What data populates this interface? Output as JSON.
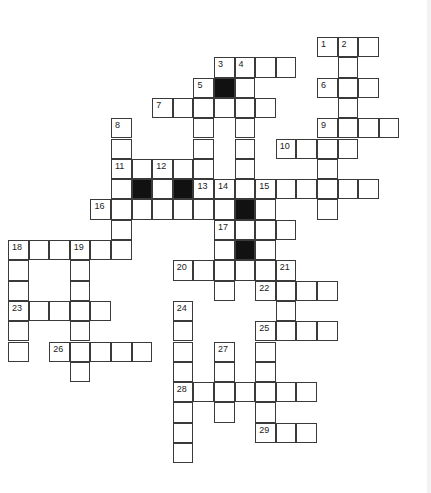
{
  "puzzle": {
    "type": "crossword",
    "colors": {
      "cell_fill": "#ffffff",
      "block_fill": "#111111",
      "border": "#3a3a3a"
    },
    "cells": [
      {
        "r": 0,
        "c": 15,
        "n": "1"
      },
      {
        "r": 0,
        "c": 16,
        "n": "2"
      },
      {
        "r": 0,
        "c": 17
      },
      {
        "r": 1,
        "c": 10,
        "n": "3"
      },
      {
        "r": 1,
        "c": 11,
        "n": "4"
      },
      {
        "r": 1,
        "c": 12
      },
      {
        "r": 1,
        "c": 13
      },
      {
        "r": 1,
        "c": 16
      },
      {
        "r": 2,
        "c": 9,
        "n": "5"
      },
      {
        "r": 2,
        "c": 10,
        "b": true
      },
      {
        "r": 2,
        "c": 11
      },
      {
        "r": 2,
        "c": 15,
        "n": "6"
      },
      {
        "r": 2,
        "c": 16
      },
      {
        "r": 2,
        "c": 17
      },
      {
        "r": 3,
        "c": 7,
        "n": "7"
      },
      {
        "r": 3,
        "c": 8
      },
      {
        "r": 3,
        "c": 9
      },
      {
        "r": 3,
        "c": 10
      },
      {
        "r": 3,
        "c": 11
      },
      {
        "r": 3,
        "c": 12
      },
      {
        "r": 3,
        "c": 16
      },
      {
        "r": 4,
        "c": 5,
        "n": "8"
      },
      {
        "r": 4,
        "c": 9
      },
      {
        "r": 4,
        "c": 11
      },
      {
        "r": 4,
        "c": 15,
        "n": "9"
      },
      {
        "r": 4,
        "c": 16
      },
      {
        "r": 4,
        "c": 17
      },
      {
        "r": 4,
        "c": 18
      },
      {
        "r": 5,
        "c": 5
      },
      {
        "r": 5,
        "c": 9
      },
      {
        "r": 5,
        "c": 11
      },
      {
        "r": 5,
        "c": 13,
        "n": "10"
      },
      {
        "r": 5,
        "c": 14
      },
      {
        "r": 5,
        "c": 15
      },
      {
        "r": 5,
        "c": 16
      },
      {
        "r": 6,
        "c": 5,
        "n": "11"
      },
      {
        "r": 6,
        "c": 6
      },
      {
        "r": 6,
        "c": 7,
        "n": "12"
      },
      {
        "r": 6,
        "c": 8
      },
      {
        "r": 6,
        "c": 9
      },
      {
        "r": 6,
        "c": 11
      },
      {
        "r": 6,
        "c": 15
      },
      {
        "r": 7,
        "c": 5
      },
      {
        "r": 7,
        "c": 6,
        "b": true
      },
      {
        "r": 7,
        "c": 7
      },
      {
        "r": 7,
        "c": 8,
        "b": true
      },
      {
        "r": 7,
        "c": 9,
        "n": "13"
      },
      {
        "r": 7,
        "c": 10,
        "n": "14"
      },
      {
        "r": 7,
        "c": 11
      },
      {
        "r": 7,
        "c": 12,
        "n": "15"
      },
      {
        "r": 7,
        "c": 13
      },
      {
        "r": 7,
        "c": 14
      },
      {
        "r": 7,
        "c": 15
      },
      {
        "r": 7,
        "c": 16
      },
      {
        "r": 7,
        "c": 17
      },
      {
        "r": 8,
        "c": 4,
        "n": "16"
      },
      {
        "r": 8,
        "c": 5
      },
      {
        "r": 8,
        "c": 6
      },
      {
        "r": 8,
        "c": 7
      },
      {
        "r": 8,
        "c": 8
      },
      {
        "r": 8,
        "c": 9
      },
      {
        "r": 8,
        "c": 10
      },
      {
        "r": 8,
        "c": 11,
        "b": true
      },
      {
        "r": 8,
        "c": 12
      },
      {
        "r": 8,
        "c": 15
      },
      {
        "r": 9,
        "c": 5
      },
      {
        "r": 9,
        "c": 10,
        "n": "17"
      },
      {
        "r": 9,
        "c": 11
      },
      {
        "r": 9,
        "c": 12
      },
      {
        "r": 9,
        "c": 13
      },
      {
        "r": 10,
        "c": 0,
        "n": "18"
      },
      {
        "r": 10,
        "c": 1
      },
      {
        "r": 10,
        "c": 2
      },
      {
        "r": 10,
        "c": 3,
        "n": "19"
      },
      {
        "r": 10,
        "c": 4
      },
      {
        "r": 10,
        "c": 5
      },
      {
        "r": 10,
        "c": 10
      },
      {
        "r": 10,
        "c": 11,
        "b": true
      },
      {
        "r": 10,
        "c": 12
      },
      {
        "r": 11,
        "c": 0
      },
      {
        "r": 11,
        "c": 3
      },
      {
        "r": 11,
        "c": 8,
        "n": "20"
      },
      {
        "r": 11,
        "c": 9
      },
      {
        "r": 11,
        "c": 10
      },
      {
        "r": 11,
        "c": 11
      },
      {
        "r": 11,
        "c": 12
      },
      {
        "r": 11,
        "c": 13,
        "n": "21"
      },
      {
        "r": 12,
        "c": 0
      },
      {
        "r": 12,
        "c": 3
      },
      {
        "r": 12,
        "c": 10
      },
      {
        "r": 12,
        "c": 12,
        "n": "22"
      },
      {
        "r": 12,
        "c": 13
      },
      {
        "r": 12,
        "c": 14
      },
      {
        "r": 12,
        "c": 15
      },
      {
        "r": 13,
        "c": 0,
        "n": "23"
      },
      {
        "r": 13,
        "c": 1
      },
      {
        "r": 13,
        "c": 2
      },
      {
        "r": 13,
        "c": 3
      },
      {
        "r": 13,
        "c": 4
      },
      {
        "r": 13,
        "c": 8,
        "n": "24"
      },
      {
        "r": 13,
        "c": 13
      },
      {
        "r": 14,
        "c": 0
      },
      {
        "r": 14,
        "c": 3
      },
      {
        "r": 14,
        "c": 8
      },
      {
        "r": 14,
        "c": 12,
        "n": "25"
      },
      {
        "r": 14,
        "c": 13
      },
      {
        "r": 14,
        "c": 14
      },
      {
        "r": 14,
        "c": 15
      },
      {
        "r": 15,
        "c": 0
      },
      {
        "r": 15,
        "c": 2,
        "n": "26"
      },
      {
        "r": 15,
        "c": 3
      },
      {
        "r": 15,
        "c": 4
      },
      {
        "r": 15,
        "c": 5
      },
      {
        "r": 15,
        "c": 6
      },
      {
        "r": 15,
        "c": 8
      },
      {
        "r": 15,
        "c": 10,
        "n": "27"
      },
      {
        "r": 15,
        "c": 12
      },
      {
        "r": 16,
        "c": 3
      },
      {
        "r": 16,
        "c": 8
      },
      {
        "r": 16,
        "c": 10
      },
      {
        "r": 16,
        "c": 12
      },
      {
        "r": 17,
        "c": 8,
        "n": "28"
      },
      {
        "r": 17,
        "c": 9
      },
      {
        "r": 17,
        "c": 10
      },
      {
        "r": 17,
        "c": 11
      },
      {
        "r": 17,
        "c": 12
      },
      {
        "r": 17,
        "c": 13
      },
      {
        "r": 17,
        "c": 14
      },
      {
        "r": 18,
        "c": 8
      },
      {
        "r": 18,
        "c": 10
      },
      {
        "r": 18,
        "c": 12
      },
      {
        "r": 19,
        "c": 8
      },
      {
        "r": 19,
        "c": 12,
        "n": "29"
      },
      {
        "r": 19,
        "c": 13
      },
      {
        "r": 19,
        "c": 14
      },
      {
        "r": 20,
        "c": 8
      }
    ]
  }
}
